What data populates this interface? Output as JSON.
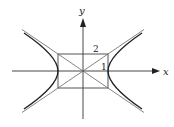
{
  "figure": {
    "axes": {
      "x_label": "x",
      "y_label": "y"
    },
    "rectangle": {
      "half_width_label": "2",
      "half_height_label": "1"
    },
    "colors": {
      "curve": "#222222",
      "asymptote": "#555555",
      "axis": "#333333",
      "background": "#ffffff"
    }
  }
}
